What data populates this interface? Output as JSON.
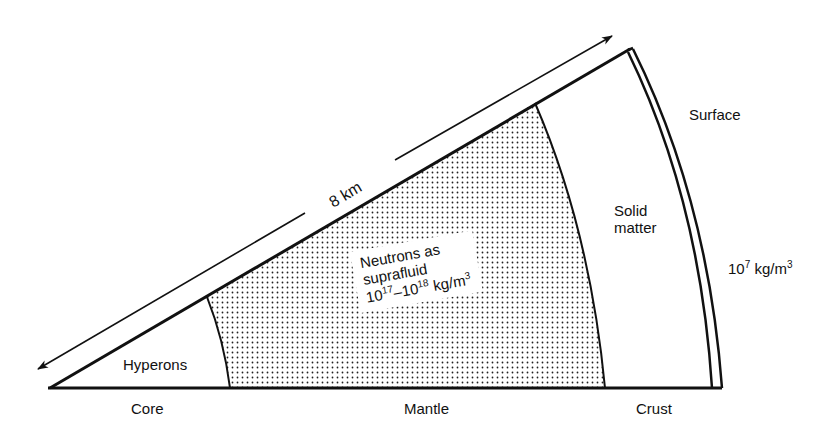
{
  "diagram": {
    "dimension_label": "8 km",
    "regions": {
      "core_inner": "Hyperons",
      "mantle_line1": "Neutrons as",
      "mantle_line2": "suprafluid",
      "mantle_density_a": "10",
      "mantle_density_a_exp": "17",
      "mantle_density_dash": "–10",
      "mantle_density_b_exp": "18",
      "mantle_density_unit": " kg/m",
      "mantle_density_unit_exp": "3",
      "solid_line1": "Solid",
      "solid_line2": "matter"
    },
    "outer_labels": {
      "surface": "Surface",
      "surface_density_base": "10",
      "surface_density_exp": "7",
      "surface_density_unit": " kg/m",
      "surface_density_unit_exp": "3"
    },
    "bottom_labels": {
      "core": "Core",
      "mantle": "Mantle",
      "crust": "Crust"
    },
    "colors": {
      "line": "#111111",
      "background": "#ffffff",
      "stipple": "#222222"
    }
  }
}
